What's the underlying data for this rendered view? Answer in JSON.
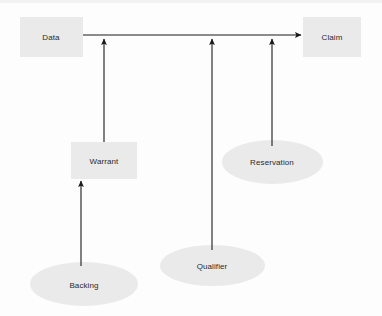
{
  "diagram": {
    "background_color": "#fdfdfd",
    "shape_fill_color": "#eaeaea",
    "line_color": "#1a1a1a",
    "text_color": "#2b2b2b",
    "nodes": [
      {
        "id": "data",
        "label": "Data",
        "shape": "rect",
        "x": 20,
        "y": 17,
        "w": 63,
        "h": 40
      },
      {
        "id": "claim",
        "label": "Claim",
        "shape": "rect",
        "x": 303,
        "y": 17,
        "w": 58,
        "h": 40
      },
      {
        "id": "warrant",
        "label": "Warrant",
        "shape": "rect",
        "x": 71,
        "y": 142,
        "w": 66,
        "h": 37
      },
      {
        "id": "reservation",
        "label": "Reservation",
        "shape": "ellipse",
        "x": 222,
        "y": 140,
        "w": 101,
        "h": 44
      },
      {
        "id": "qualifier",
        "label": "Qualifier",
        "shape": "ellipse",
        "x": 160,
        "y": 245,
        "w": 105,
        "h": 41
      },
      {
        "id": "backing",
        "label": "Backing",
        "shape": "ellipse",
        "x": 30,
        "y": 262,
        "w": 108,
        "h": 44
      }
    ],
    "edges": [
      {
        "id": "data-to-claim",
        "from": "data",
        "to": "claim",
        "type": "horizontal-arrow",
        "x1": 83,
        "y1": 35,
        "x2": 303,
        "y2": 35
      },
      {
        "id": "warrant-to-claim",
        "from": "warrant",
        "to": "claim",
        "type": "vertical-arrow",
        "x1": 104,
        "y1": 142,
        "x2": 104,
        "y2": 37
      },
      {
        "id": "qualifier-to-claim",
        "from": "qualifier",
        "to": "claim",
        "type": "vertical-arrow",
        "x1": 212,
        "y1": 250,
        "x2": 212,
        "y2": 37
      },
      {
        "id": "reservation-to-claim",
        "from": "reservation",
        "to": "claim",
        "type": "vertical-arrow",
        "x1": 272,
        "y1": 146,
        "x2": 272,
        "y2": 37
      },
      {
        "id": "backing-to-warrant",
        "from": "backing",
        "to": "warrant",
        "type": "vertical-arrow",
        "x1": 81,
        "y1": 266,
        "x2": 81,
        "y2": 179
      }
    ]
  }
}
